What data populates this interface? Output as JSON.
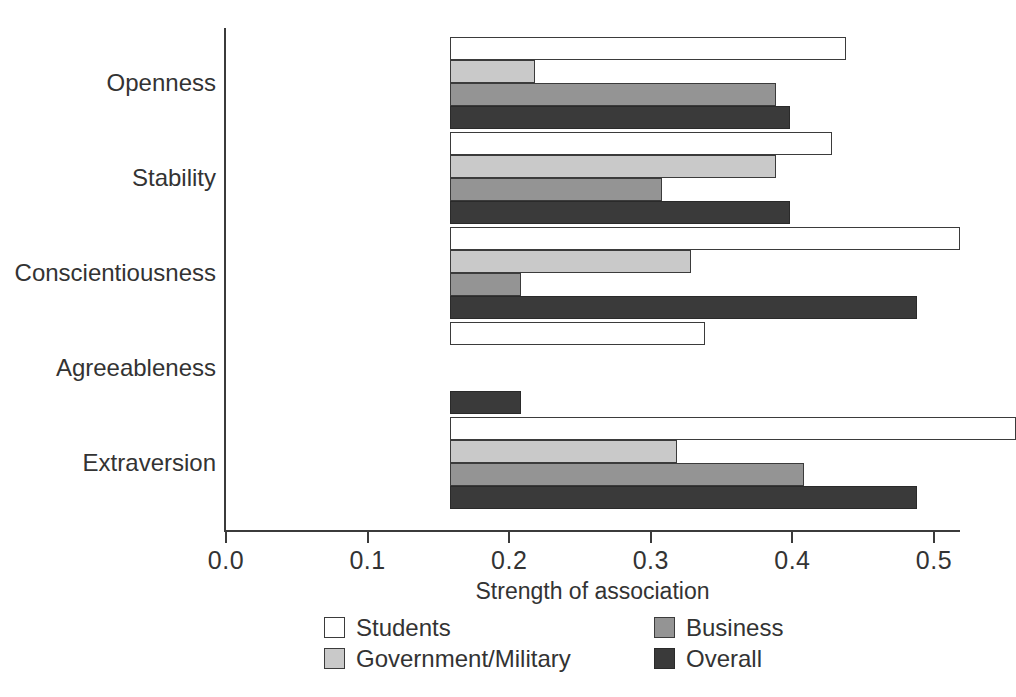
{
  "chart_data": {
    "type": "bar",
    "orientation": "horizontal",
    "title": "",
    "xlabel": "Strength of association",
    "ylabel": "",
    "xlim": [
      0.0,
      0.5
    ],
    "xticks": [
      "0.0",
      "0.1",
      "0.2",
      "0.3",
      "0.4",
      "0.5"
    ],
    "xtick_values": [
      0.0,
      0.1,
      0.2,
      0.3,
      0.4,
      0.5
    ],
    "grid": false,
    "legend_position": "bottom",
    "categories": [
      "Openness",
      "Stability",
      "Conscientiousness",
      "Agreeableness",
      "Extraversion"
    ],
    "series": [
      {
        "name": "Students",
        "color": "#ffffff",
        "values": [
          0.28,
          0.27,
          0.36,
          0.18,
          0.4
        ]
      },
      {
        "name": "Government/Military",
        "color": "#c9c9c9",
        "values": [
          0.06,
          0.23,
          0.17,
          0.0,
          0.16
        ]
      },
      {
        "name": "Business",
        "color": "#949494",
        "values": [
          0.23,
          0.15,
          0.05,
          0.0,
          0.25
        ]
      },
      {
        "name": "Overall",
        "color": "#3a3a3a",
        "values": [
          0.24,
          0.24,
          0.33,
          0.05,
          0.33
        ]
      }
    ]
  },
  "axis": {
    "xlabel": "Strength of association",
    "ticks": [
      {
        "label": "0.0",
        "value": 0.0
      },
      {
        "label": "0.1",
        "value": 0.1
      },
      {
        "label": "0.2",
        "value": 0.2
      },
      {
        "label": "0.3",
        "value": 0.3
      },
      {
        "label": "0.4",
        "value": 0.4
      },
      {
        "label": "0.5",
        "value": 0.5
      }
    ]
  },
  "legend": {
    "entries": [
      {
        "label": "Students",
        "key": "students"
      },
      {
        "label": "Business",
        "key": "business"
      },
      {
        "label": "Government/Military",
        "key": "government"
      },
      {
        "label": "Overall",
        "key": "overall"
      }
    ]
  },
  "colors": {
    "students": "#ffffff",
    "government": "#c9c9c9",
    "business": "#949494",
    "overall": "#3a3a3a",
    "axis": "#3b3b3b",
    "text": "#333333",
    "background": "#ffffff"
  }
}
